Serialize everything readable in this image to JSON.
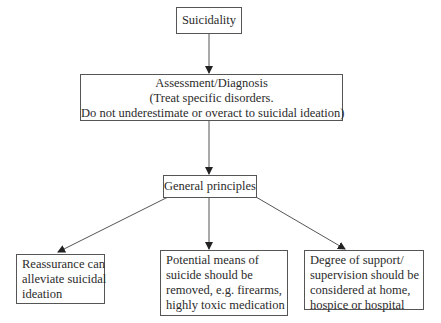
{
  "diagram": {
    "type": "flowchart",
    "nodes": {
      "root": {
        "id": "suicidality",
        "lines": [
          "Suicidality"
        ]
      },
      "assessment": {
        "id": "assessment",
        "lines": [
          "Assessment/Diagnosis",
          "(Treat specific disorders.",
          "Do not underestimate or overact to suicidal ideation)"
        ]
      },
      "principles": {
        "id": "general-principles",
        "lines": [
          "General principles"
        ]
      },
      "reassurance": {
        "id": "reassurance",
        "lines": [
          "Reassurance can",
          "alleviate suicidal",
          "ideation"
        ]
      },
      "means": {
        "id": "means-removal",
        "lines": [
          "Potential means of",
          "suicide should be",
          "removed, e.g. firearms,",
          "highly toxic medication"
        ]
      },
      "support": {
        "id": "support",
        "lines": [
          "Degree of support/",
          "supervision should be",
          "considered at home,",
          "hospice or hospital"
        ]
      }
    },
    "edges": [
      {
        "from": "suicidality",
        "to": "assessment"
      },
      {
        "from": "assessment",
        "to": "general-principles"
      },
      {
        "from": "general-principles",
        "to": "reassurance"
      },
      {
        "from": "general-principles",
        "to": "means-removal"
      },
      {
        "from": "general-principles",
        "to": "support"
      }
    ],
    "colors": {
      "stroke": "#555555",
      "text": "#2b2b2b",
      "background": "#ffffff"
    }
  }
}
